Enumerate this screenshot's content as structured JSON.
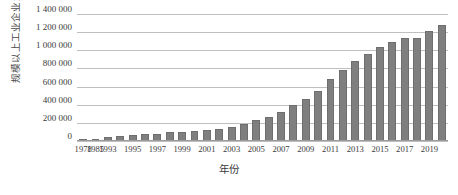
{
  "chart_data": {
    "type": "bar",
    "title": "",
    "xlabel": "年份",
    "ylabel": "规模以上工业企业资产总计/亿元",
    "ylim": [
      0,
      1400000
    ],
    "ytick_labels": [
      "1 400 000",
      "1 200 000",
      "1 000 000",
      "800 000",
      "600 000",
      "400 000",
      "200 000",
      "0"
    ],
    "ytick_values": [
      1400000,
      1200000,
      1000000,
      800000,
      600000,
      400000,
      200000,
      0
    ],
    "grid": true,
    "legend": "none",
    "bar_color": "#7f7f7f",
    "gridline_color": "#bfbfbf",
    "categories": [
      "1978",
      "1985",
      "1993",
      "1994",
      "1995",
      "1996",
      "1997",
      "1998",
      "1999",
      "2000",
      "2001",
      "2002",
      "2003",
      "2004",
      "2005",
      "2006",
      "2007",
      "2008",
      "2009",
      "2010",
      "2011",
      "2012",
      "2013",
      "2014",
      "2015",
      "2016",
      "2017",
      "2018",
      "2019",
      "2020"
    ],
    "values": [
      4488,
      11000,
      36000,
      45000,
      53000,
      62000,
      68000,
      85000,
      91000,
      100000,
      113000,
      125000,
      145000,
      173000,
      217000,
      259000,
      311000,
      389000,
      450000,
      544000,
      674000,
      769000,
      870000,
      950000,
      1020000,
      1080000,
      1120000,
      1130000,
      1200000,
      1270000
    ],
    "xtick_labels": [
      "1978",
      "1985",
      "1993",
      "1995",
      "1997",
      "1999",
      "2001",
      "2003",
      "2005",
      "2007",
      "2009",
      "2011",
      "2013",
      "2015",
      "2017",
      "2019"
    ]
  }
}
